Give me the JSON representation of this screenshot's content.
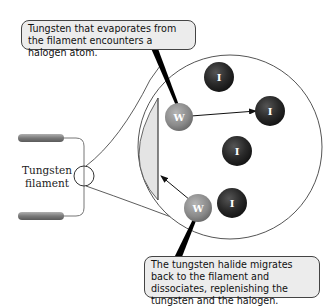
{
  "callouts": {
    "top": "Tungsten that evaporates from the filament encounters a halogen atom.",
    "bottom": "The tungsten halide migrates back to the filament and dissociates, replenishing the tungsten and the halogen."
  },
  "labels": {
    "filament_line1": "Tungsten",
    "filament_line2": "filament"
  },
  "atoms": {
    "tungsten_symbol": "W",
    "halogen_symbol": "I"
  },
  "colors": {
    "tungsten_atom": "#8a8a8a",
    "halogen_atom": "#2a2a2a",
    "filament_surface": "#e4e4e4",
    "callout_bg": "#ececec",
    "electrode": "#888888"
  }
}
